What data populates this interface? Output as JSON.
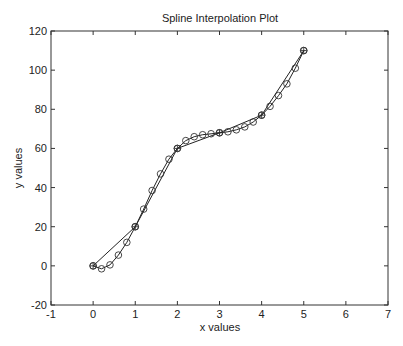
{
  "chart_data": {
    "type": "line",
    "title": "Spline Interpolation Plot",
    "xlabel": "x values",
    "ylabel": "y values",
    "xlim": [
      -1,
      7
    ],
    "ylim": [
      -20,
      120
    ],
    "xticks": [
      -1,
      0,
      1,
      2,
      3,
      4,
      5,
      6,
      7
    ],
    "yticks": [
      -20,
      0,
      20,
      40,
      60,
      80,
      100,
      120
    ],
    "grid": false,
    "legend": null,
    "series": [
      {
        "name": "data points (linear)",
        "style": "line with circle+plus markers",
        "x": [
          0,
          1,
          2,
          3,
          4,
          5
        ],
        "y": [
          0,
          20,
          60,
          68,
          77,
          110
        ]
      },
      {
        "name": "spline interpolation",
        "style": "line with circle markers",
        "x": [
          0,
          0.2,
          0.4,
          0.6,
          0.8,
          1.0,
          1.2,
          1.4,
          1.6,
          1.8,
          2.0,
          2.2,
          2.4,
          2.6,
          2.8,
          3.0,
          3.2,
          3.4,
          3.6,
          3.8,
          4.0,
          4.2,
          4.4,
          4.6,
          4.8,
          5.0
        ],
        "y": [
          0,
          -1.5,
          0.5,
          5.5,
          12,
          20,
          29,
          38.5,
          47,
          54.5,
          60,
          64,
          66,
          67,
          67.5,
          68,
          68.5,
          69.5,
          71,
          73.5,
          77,
          81.5,
          87,
          93,
          101,
          110
        ]
      }
    ]
  }
}
